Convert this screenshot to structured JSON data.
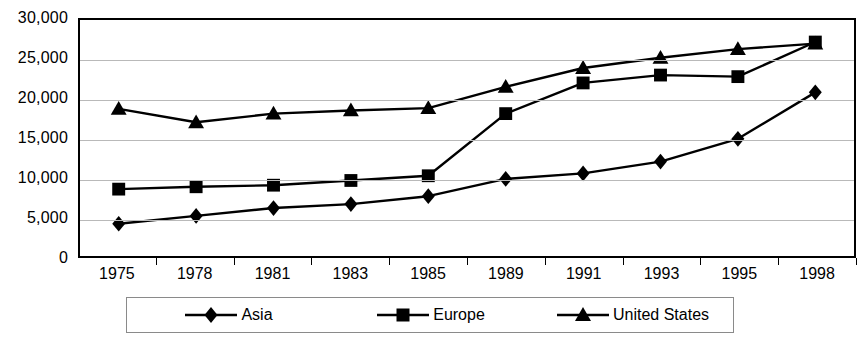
{
  "chart_data": {
    "type": "line",
    "title": "",
    "xlabel": "",
    "ylabel": "",
    "categories": [
      "1975",
      "1978",
      "1981",
      "1983",
      "1985",
      "1989",
      "1991",
      "1993",
      "1995",
      "1998"
    ],
    "ylim": [
      0,
      30000
    ],
    "ytick_values": [
      0,
      5000,
      10000,
      15000,
      20000,
      25000,
      30000
    ],
    "ytick_labels": [
      "0",
      "5,000",
      "10,000",
      "15,000",
      "20,000",
      "25,000",
      "30,000"
    ],
    "grid": true,
    "legend_position": "bottom",
    "series": [
      {
        "name": "Asia",
        "marker": "diamond",
        "color": "#000000",
        "values": [
          4100,
          5100,
          6100,
          6600,
          7600,
          9800,
          10500,
          12000,
          14900,
          20800
        ]
      },
      {
        "name": "Europe",
        "marker": "square",
        "color": "#000000",
        "values": [
          8500,
          8800,
          9000,
          9600,
          10200,
          18100,
          22000,
          23000,
          22800,
          27200
        ]
      },
      {
        "name": "United States",
        "marker": "triangle",
        "color": "#000000",
        "values": [
          18700,
          17000,
          18100,
          18500,
          18800,
          21500,
          23900,
          25200,
          26300,
          27000
        ]
      }
    ]
  },
  "legend": {
    "entries": [
      {
        "label": "Asia",
        "marker": "diamond-marker-icon"
      },
      {
        "label": "Europe",
        "marker": "square-marker-icon"
      },
      {
        "label": "United States",
        "marker": "triangle-marker-icon"
      }
    ]
  }
}
